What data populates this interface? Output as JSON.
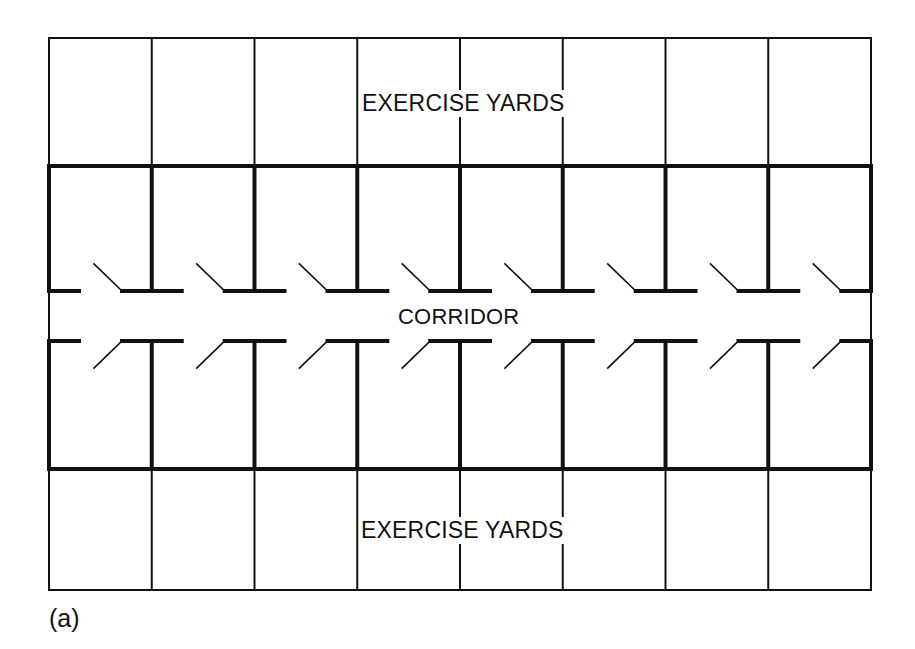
{
  "diagram": {
    "caption": "(a)",
    "labels": {
      "top_zone": "EXERCISE YARDS",
      "corridor": "CORRIDOR",
      "bottom_zone": "EXERCISE YARDS"
    },
    "colors": {
      "line": "#111111",
      "background": "#ffffff"
    },
    "layout": {
      "num_cells_per_side": 8,
      "left": 49,
      "right": 871,
      "top": 38,
      "upper_block_top": 166,
      "corridor_upper_wall": 291,
      "corridor_lower_wall": 341,
      "lower_block_bottom": 469,
      "bottom": 590,
      "thin_stroke": 2,
      "thick_stroke": 4,
      "door_stroke": 1.6,
      "stub_length": 30,
      "door_hinge_offset": 73,
      "door_tip_offset": 45,
      "door_swing_depth": 27
    },
    "zones": [
      {
        "name": "exercise-yards-top",
        "rows": 1,
        "cells": 8
      },
      {
        "name": "cells-upper",
        "rows": 1,
        "cells": 8,
        "doors": 8,
        "door_direction": "into-cell"
      },
      {
        "name": "corridor",
        "rows": 1
      },
      {
        "name": "cells-lower",
        "rows": 1,
        "cells": 8,
        "doors": 8,
        "door_direction": "into-cell"
      },
      {
        "name": "exercise-yards-bottom",
        "rows": 1,
        "cells": 8
      }
    ]
  }
}
